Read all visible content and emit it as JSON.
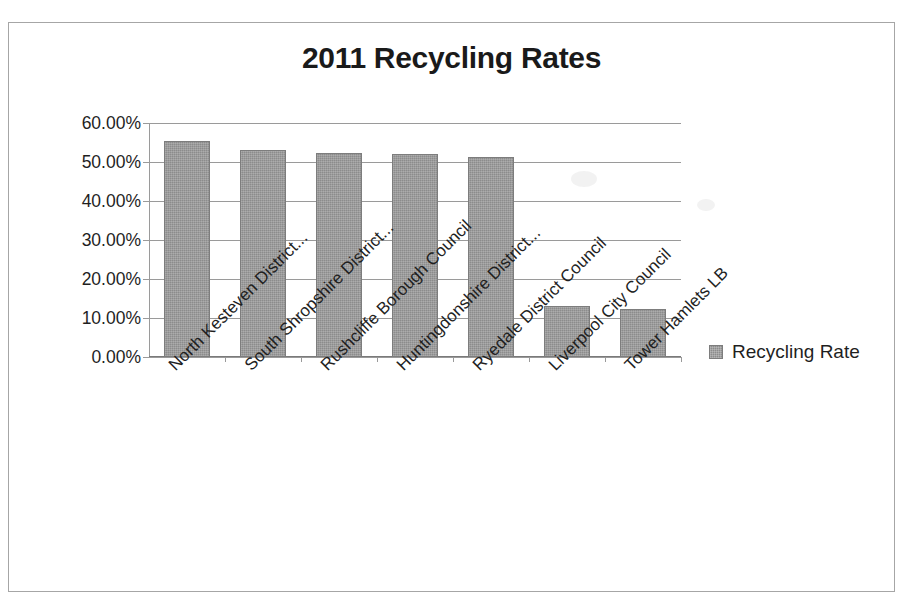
{
  "chart_data": {
    "type": "bar",
    "title": "2011 Recycling Rates",
    "xlabel": "",
    "ylabel": "",
    "ylim": [
      0,
      60
    ],
    "ytick_labels": [
      "60.00%",
      "50.00%",
      "40.00%",
      "30.00%",
      "20.00%",
      "10.00%",
      "0.00%"
    ],
    "ytick_values": [
      60,
      50,
      40,
      30,
      20,
      10,
      0
    ],
    "grid": true,
    "legend_position": "right",
    "categories": [
      "North Kesteven District...",
      "South Shropshire District...",
      "Rushcliffe Borough Council",
      "Huntingdonshire District...",
      "Ryedale District Council",
      "Liverpool City Council",
      "Tower Hamlets LB"
    ],
    "series": [
      {
        "name": "Recycling Rate",
        "color": "#8c8c8c",
        "values": [
          55.3,
          53.2,
          52.3,
          52.0,
          51.4,
          13.2,
          12.3
        ]
      }
    ]
  },
  "legend": {
    "entries": [
      {
        "label": "Recycling Rate",
        "swatch_color": "#8c8c8c"
      }
    ]
  }
}
